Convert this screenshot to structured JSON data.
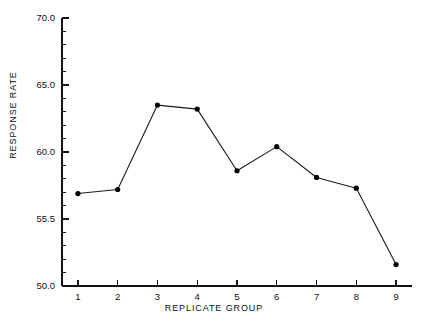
{
  "chart_data": {
    "type": "line",
    "title": "",
    "xlabel": "REPLICATE GROUP",
    "ylabel": "RESPONSE RATE",
    "x": [
      1,
      2,
      3,
      4,
      5,
      6,
      7,
      8,
      9
    ],
    "categories": [
      "1",
      "2",
      "3",
      "4",
      "5",
      "6",
      "7",
      "8",
      "9"
    ],
    "values": [
      56.9,
      57.2,
      63.5,
      63.2,
      58.6,
      60.4,
      58.1,
      57.3,
      51.6
    ],
    "series": [
      {
        "name": "Response Rate",
        "values": [
          56.9,
          57.2,
          63.5,
          63.2,
          58.6,
          60.4,
          58.1,
          57.3,
          51.6
        ]
      }
    ],
    "xlim": [
      0.6,
      9.4
    ],
    "ylim": [
      50.0,
      70.0
    ],
    "grid": false,
    "legend": false,
    "legend_position": "none",
    "marker": "filled-circle",
    "line_color": "#1a1a1a",
    "marker_color": "#000000",
    "background_color": "#ffffff",
    "y_tick_labels": [
      "70.0",
      "65.0",
      "60.0",
      "55.5",
      "50.0"
    ],
    "y_tick_values": [
      70.0,
      65.0,
      60.0,
      55.0,
      50.0
    ],
    "y_minor_tick_count_per_interval": 4,
    "x_tick_labels": [
      "1",
      "2",
      "3",
      "4",
      "5",
      "6",
      "7",
      "8",
      "9"
    ],
    "x_tick_values": [
      1,
      2,
      3,
      4,
      5,
      6,
      7,
      8,
      9
    ]
  }
}
